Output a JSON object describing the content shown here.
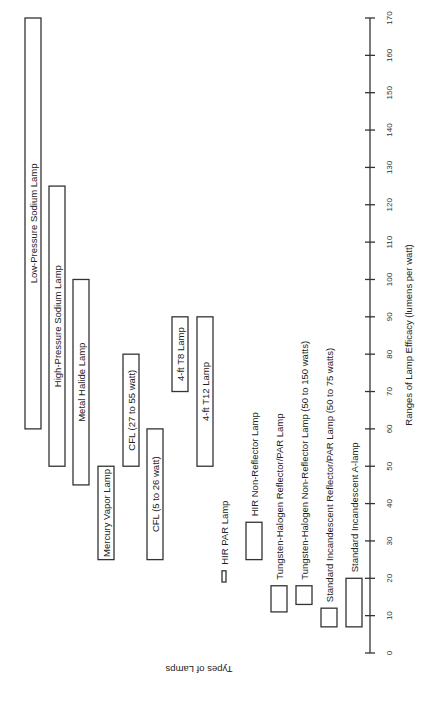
{
  "chart_data": {
    "type": "bar",
    "orientation": "floating-range (rotated 90°, value axis vertical on right)",
    "title": "",
    "xlabel": "Types of Lamps",
    "ylabel": "Ranges of Lamp Efficacy (lumens per watt)",
    "ylim": [
      0,
      170
    ],
    "ticks": [
      0,
      10,
      20,
      30,
      40,
      50,
      60,
      70,
      80,
      90,
      100,
      110,
      120,
      130,
      140,
      150,
      160,
      170
    ],
    "grid": false,
    "categories": [
      "Low-Pressure Sodium Lamp",
      "High-Pressure Sodium Lamp",
      "Metal Halide Lamp",
      "Mercury Vapor Lamp",
      "CFL (27 to 55 watt)",
      "CFL (5 to 26 watt)",
      "4-ft T8 Lamp",
      "4-ft T12 Lamp",
      "HIR PAR Lamp",
      "HIR Non-Reflector Lamp",
      "Tungsten-Halogen Reflector/PAR Lamp",
      "Tungsten-Halogen Non-Reflector Lamp (50 to 150 watts)",
      "Standard Incandescent Reflector/PAR Lamp (50 to 75 watts)",
      "Standard Incandescent A-lamp"
    ],
    "ranges": [
      {
        "name": "Low-Pressure Sodium Lamp",
        "min": 60,
        "max": 170
      },
      {
        "name": "High-Pressure Sodium Lamp",
        "min": 50,
        "max": 125
      },
      {
        "name": "Metal Halide Lamp",
        "min": 45,
        "max": 100
      },
      {
        "name": "Mercury Vapor Lamp",
        "min": 25,
        "max": 50
      },
      {
        "name": "CFL (27 to 55 watt)",
        "min": 50,
        "max": 80
      },
      {
        "name": "CFL (5 to 26 watt)",
        "min": 25,
        "max": 60
      },
      {
        "name": "4-ft T8 Lamp",
        "min": 70,
        "max": 90
      },
      {
        "name": "4-ft T12 Lamp",
        "min": 50,
        "max": 90
      },
      {
        "name": "HIR PAR Lamp",
        "min": 19,
        "max": 22
      },
      {
        "name": "HIR Non-Reflector Lamp",
        "min": 25,
        "max": 35
      },
      {
        "name": "Tungsten-Halogen Reflector/PAR Lamp",
        "min": 11,
        "max": 18
      },
      {
        "name": "Tungsten-Halogen Non-Reflector Lamp (50 to 150 watts)",
        "min": 13,
        "max": 18
      },
      {
        "name": "Standard Incandescent Reflector/PAR Lamp (50 to 75 watts)",
        "min": 7,
        "max": 12
      },
      {
        "name": "Standard Incandescent A-lamp",
        "min": 7,
        "max": 20
      }
    ]
  },
  "layout": {
    "bar_x": [
      25,
      49,
      73,
      98,
      123,
      147,
      172,
      197,
      222,
      246,
      271,
      296,
      321,
      346
    ],
    "bar_w": [
      16,
      16,
      16,
      16,
      16,
      16,
      16,
      16,
      4,
      16,
      16,
      16,
      16,
      16
    ],
    "label_inside": [
      true,
      true,
      true,
      true,
      true,
      true,
      true,
      true,
      false,
      false,
      false,
      false,
      false,
      false
    ]
  }
}
